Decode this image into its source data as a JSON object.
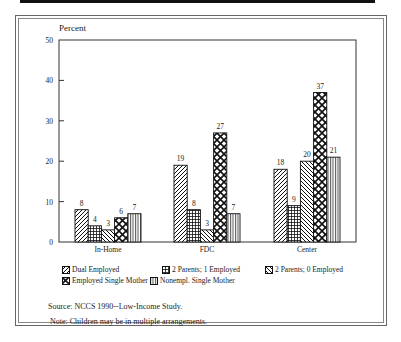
{
  "chart_data": {
    "type": "bar",
    "title": "",
    "ylabel": "Percent",
    "xlabel": "",
    "ylim": [
      0,
      50
    ],
    "yticks": [
      0,
      10,
      20,
      30,
      40,
      50
    ],
    "grid": false,
    "legend_position": "bottom",
    "categories": [
      "In-Home",
      "FDC",
      "Center"
    ],
    "series": [
      {
        "name": "Dual Employed",
        "values": [
          8,
          19,
          18
        ],
        "pattern": "diagonal-forward"
      },
      {
        "name": "2 Parents; 1 Employed",
        "values": [
          4,
          8,
          9
        ],
        "pattern": "grid"
      },
      {
        "name": "2 Parents; 0 Employed",
        "values": [
          3,
          3,
          20
        ],
        "pattern": "diagonal-back"
      },
      {
        "name": "Employed Single Mother",
        "values": [
          6,
          27,
          37
        ],
        "pattern": "diamond-crosshatch"
      },
      {
        "name": "Nonempl. Single Mother",
        "values": [
          7,
          7,
          21
        ],
        "pattern": "vertical"
      }
    ]
  },
  "legend": {
    "items": [
      "Dual Employed",
      "2 Parents; 1 Employed",
      "2 Parents; 0 Employed",
      "Employed Single Mother",
      "Nonempl. Single Mother"
    ]
  },
  "footer": {
    "source": "Source: NCCS 1990--Low-Income Study.",
    "note": "Note: Children may be in multiple arrangements."
  }
}
